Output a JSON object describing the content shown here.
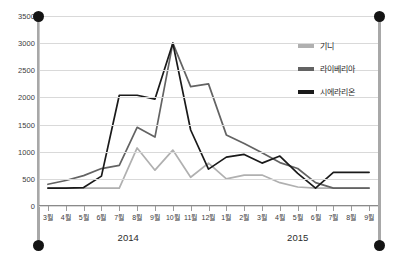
{
  "chart_data": {
    "type": "line",
    "title": "",
    "xlabel": "",
    "ylabel": "",
    "ylim": [
      0,
      3500
    ],
    "yticks": [
      0,
      500,
      1000,
      1500,
      2000,
      2500,
      3000,
      3500
    ],
    "grid": true,
    "legend_position": "top-right",
    "categories": [
      "3월",
      "4월",
      "5월",
      "6월",
      "7월",
      "8월",
      "9월",
      "10월",
      "11월",
      "12월",
      "1월",
      "2월",
      "3월",
      "4월",
      "5월",
      "6월",
      "7월",
      "8월",
      "9월"
    ],
    "x_group_labels": [
      "2014",
      "2015"
    ],
    "series": [
      {
        "name": "기니",
        "color": "#b0b0b0",
        "values": [
          330,
          330,
          330,
          330,
          330,
          1070,
          660,
          1030,
          530,
          790,
          500,
          570,
          570,
          430,
          350,
          330,
          330,
          330,
          330
        ]
      },
      {
        "name": "라이베리아",
        "color": "#636363",
        "values": [
          400,
          470,
          560,
          690,
          750,
          1450,
          1270,
          3000,
          2200,
          2250,
          1310,
          1150,
          980,
          800,
          690,
          430,
          330,
          330,
          330
        ]
      },
      {
        "name": "시에라리온",
        "color": "#1a1a1a",
        "values": [
          330,
          330,
          340,
          550,
          2040,
          2040,
          1970,
          3000,
          1400,
          680,
          900,
          950,
          790,
          920,
          600,
          330,
          620,
          620,
          620
        ]
      }
    ]
  },
  "legend": {
    "items": [
      {
        "label": "기니",
        "color": "#b0b0b0"
      },
      {
        "label": "라이베리아",
        "color": "#636363"
      },
      {
        "label": "시에라리온",
        "color": "#1a1a1a"
      }
    ]
  },
  "selection": {
    "handles": [
      "top-left",
      "top-right",
      "bottom-left",
      "bottom-right"
    ]
  }
}
